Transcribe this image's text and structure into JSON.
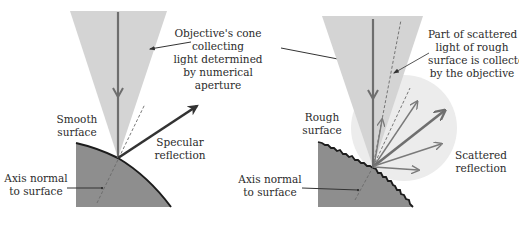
{
  "colors": {
    "background": "#ffffff",
    "cone": "#d4d4d4",
    "scatter_lobe": "#ececec",
    "material": "#8e8e8e",
    "surface_edge": "#1c1c1c",
    "beam": "#6e6e6e",
    "reflection": "#333333",
    "scatter_arrows": "#7a7a7a",
    "normal_dash": "#6a6a6a",
    "leader": "#333333",
    "text": "#2b2b2b"
  },
  "center_label": {
    "lines": [
      "Objective's cone",
      "collecting",
      "light determined",
      "by numerical",
      "aperture"
    ]
  },
  "left_panel": {
    "surface_label": {
      "lines": [
        "Smooth",
        "surface"
      ]
    },
    "reflection_label": {
      "lines": [
        "Specular",
        "reflection"
      ]
    },
    "normal_label": {
      "lines": [
        "Axis normal",
        "to surface"
      ]
    }
  },
  "right_panel": {
    "surface_label": {
      "lines": [
        "Rough",
        "surface"
      ]
    },
    "collected_label": {
      "lines": [
        "Part of scattered",
        "light of rough",
        "surface is collected",
        "by the objective"
      ]
    },
    "scatter_label": {
      "lines": [
        "Scattered",
        "reflection"
      ]
    },
    "normal_label": {
      "lines": [
        "Axis normal",
        "to surface"
      ]
    }
  }
}
